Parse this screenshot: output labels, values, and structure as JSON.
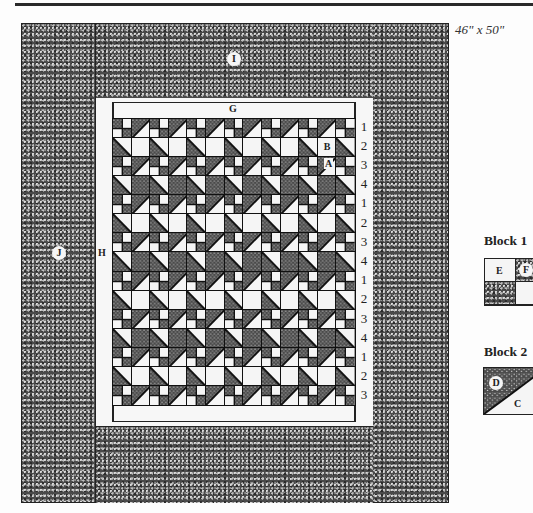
{
  "diagram": {
    "size_label": "46\" x 50\"",
    "border_labels": {
      "outer_top_bottom": "I",
      "outer_sides": "J",
      "inner_sides": "H",
      "inner_top_bottom": "G"
    },
    "piece_labels_in_center": [
      "B",
      "A"
    ],
    "row_numbers": [
      "1",
      "2",
      "3",
      "4",
      "1",
      "2",
      "3",
      "4",
      "1",
      "2",
      "3",
      "4",
      "1",
      "2",
      "3"
    ],
    "grid": {
      "columns": 13,
      "rows": 15
    },
    "legend": {
      "block1": {
        "title": "Block 1",
        "labels": [
          "E",
          "F"
        ]
      },
      "block2": {
        "title": "Block 2",
        "labels": [
          "D",
          "C"
        ]
      }
    },
    "colors": {
      "dark_fabric": "#4a4a4a",
      "light_fabric": "#f5f5f5",
      "outline": "#222222"
    }
  }
}
